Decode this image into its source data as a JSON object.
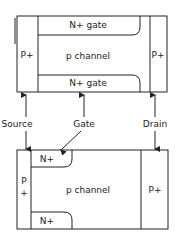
{
  "top_device": {
    "left_region": "P+",
    "right_region": "P+",
    "top_gate": "N+ gate",
    "channel": "p channel",
    "bottom_gate": "N+ gate"
  },
  "terminals": {
    "source": "Source",
    "gate": "Gate",
    "drain": "Drain"
  },
  "bottom_device": {
    "left_region_line1": "P",
    "left_region_line2": "+",
    "top_gate": "N+",
    "channel": "p channel",
    "bottom_gate": "N+",
    "right_region": "P+"
  },
  "colors": {
    "line": "#222222",
    "background": "#ffffff"
  }
}
